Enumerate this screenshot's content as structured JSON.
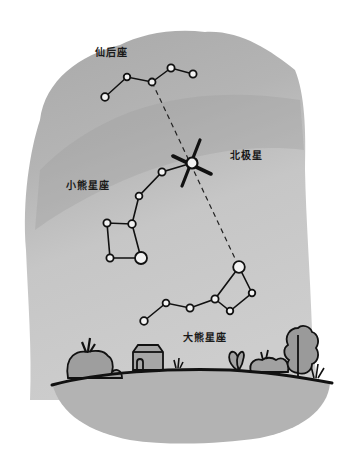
{
  "labels": {
    "cassiopeia": "仙后座",
    "polaris": "北极星",
    "ursa_minor": "小熊星座",
    "ursa_major": "大熊星座"
  },
  "colors": {
    "sky_light": "#c4c4c4",
    "sky_dark": "#a8a8a8",
    "ground": "#b3b3b3",
    "ink": "#111111",
    "star_fill": "#f2f2f2"
  },
  "constellations": {
    "cassiopeia": {
      "stars": [
        [
          105,
          97
        ],
        [
          127,
          77
        ],
        [
          152,
          82
        ],
        [
          171,
          68
        ],
        [
          193,
          74
        ]
      ]
    },
    "ursa_minor": {
      "stars": [
        [
          192,
          163
        ],
        [
          162,
          172
        ],
        [
          139,
          196
        ],
        [
          132,
          224
        ],
        [
          107,
          223
        ],
        [
          110,
          258
        ],
        [
          141,
          258
        ]
      ]
    },
    "ursa_major": {
      "stars": [
        [
          144,
          321
        ],
        [
          166,
          303
        ],
        [
          190,
          308
        ],
        [
          215,
          299
        ],
        [
          239,
          267
        ],
        [
          252,
          293
        ],
        [
          230,
          311
        ]
      ]
    }
  }
}
